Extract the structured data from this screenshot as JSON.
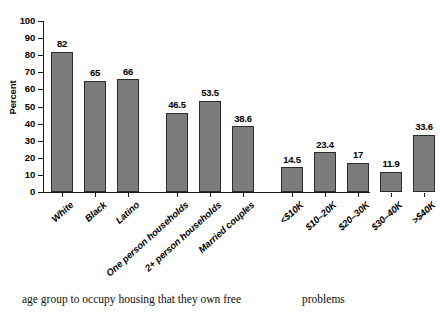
{
  "chart_data": {
    "type": "bar",
    "title": "",
    "xlabel": "",
    "ylabel": "Percent",
    "ylim": [
      0,
      100
    ],
    "yticks": [
      0,
      10,
      20,
      30,
      40,
      50,
      60,
      70,
      80,
      90,
      100
    ],
    "ytick_labels": [
      "0",
      "10",
      "20",
      "30",
      "40",
      "50",
      "60",
      "70",
      "80",
      "90",
      "100"
    ],
    "grid": false,
    "legend": "none",
    "bar_color": "#7c7c7c",
    "bar_edge_color": "#2b2b2b",
    "axis_color": "#1a1a1a",
    "categories": [
      "White",
      "Black",
      "Latino",
      "One person households",
      "2+ person households",
      "Married couples",
      "<$10K",
      "$10–20K",
      "$20–30K",
      "$30–40K",
      ">$40K"
    ],
    "values": [
      82,
      65,
      66,
      46.5,
      53.5,
      38.6,
      14.5,
      23.4,
      17,
      11.9,
      33.6
    ],
    "value_labels": [
      "82",
      "65",
      "66",
      "46.5",
      "53.5",
      "38.6",
      "14.5",
      "23.4",
      "17",
      "11.9",
      "33.6"
    ],
    "groups": [
      {
        "name": "race-ethnicity",
        "indices": [
          0,
          1,
          2
        ]
      },
      {
        "name": "household-type",
        "indices": [
          3,
          4,
          5
        ]
      },
      {
        "name": "income",
        "indices": [
          6,
          7,
          8,
          9,
          10
        ]
      }
    ]
  },
  "page_text": {
    "left_column": "age group to occupy housing that they own free",
    "right_column": "problems"
  }
}
